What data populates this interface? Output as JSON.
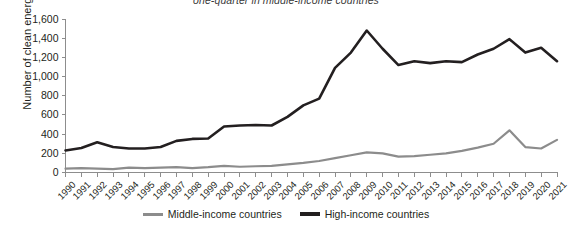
{
  "chart_data": {
    "type": "line",
    "title": "one-quarter in middle-income countries",
    "xlabel": "",
    "ylabel": "Number of clean energy start-ups",
    "ylim": [
      0,
      1600
    ],
    "ytick_values": [
      0,
      200,
      400,
      600,
      800,
      1000,
      1200,
      1400,
      1600
    ],
    "ytick_labels": [
      "0",
      "200",
      "400",
      "600",
      "800",
      "1,000",
      "1,200",
      "1,400",
      "1,600"
    ],
    "grid": false,
    "legend_position": "bottom",
    "categories": [
      "1990",
      "1991",
      "1992",
      "1993",
      "1994",
      "1995",
      "1996",
      "1997",
      "1998",
      "1999",
      "2000",
      "2001",
      "2002",
      "2003",
      "2004",
      "2005",
      "2006",
      "2007",
      "2008",
      "2009",
      "2010",
      "2011",
      "2012",
      "2013",
      "2014",
      "2015",
      "2016",
      "2017",
      "2018",
      "2019",
      "2020",
      "2021"
    ],
    "series": [
      {
        "name": "Middle-income countries",
        "color": "#8c8c8c",
        "values": [
          40,
          45,
          40,
          35,
          50,
          45,
          50,
          55,
          45,
          55,
          70,
          60,
          65,
          70,
          85,
          100,
          120,
          150,
          180,
          210,
          200,
          165,
          170,
          185,
          200,
          225,
          260,
          300,
          440,
          265,
          250,
          340
        ]
      },
      {
        "name": "High-income countries",
        "color": "#231f20",
        "values": [
          230,
          255,
          315,
          265,
          250,
          250,
          265,
          330,
          350,
          355,
          480,
          490,
          495,
          490,
          580,
          700,
          770,
          1090,
          1250,
          1480,
          1290,
          1120,
          1160,
          1140,
          1160,
          1150,
          1230,
          1290,
          1390,
          1250,
          1300,
          1160
        ]
      }
    ]
  },
  "legend": {
    "items": [
      {
        "label": "Middle-income countries",
        "color": "#8c8c8c"
      },
      {
        "label": "High-income countries",
        "color": "#231f20"
      }
    ]
  }
}
